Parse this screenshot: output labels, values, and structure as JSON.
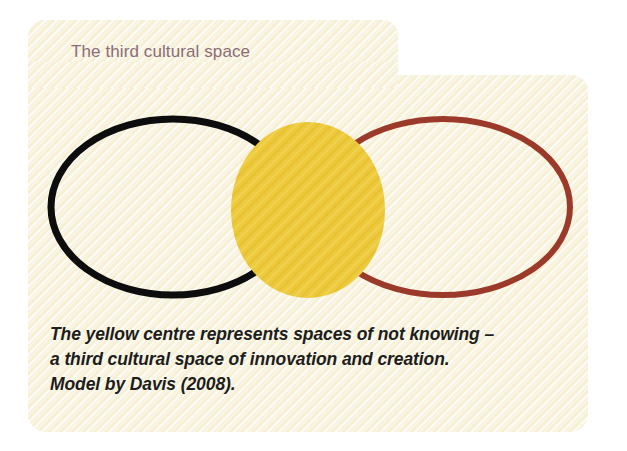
{
  "card": {
    "background_color": "#f7f2dd",
    "texture": "diagonal-stripe-paper"
  },
  "title": {
    "text": "The third cultural space",
    "color": "#8a6d78"
  },
  "diagram": {
    "name": "third-cultural-space-venn",
    "type": "venn-two-circle-overlap",
    "left_ellipse": {
      "label": "left-culture-ellipse",
      "stroke_color": "#0d0d0d",
      "stroke_width": 7,
      "cx": 145,
      "cy": 112,
      "rx": 122,
      "ry": 88
    },
    "right_ellipse": {
      "label": "right-culture-ellipse",
      "stroke_color": "#9b3a2a",
      "stroke_width": 6,
      "cx": 415,
      "cy": 112,
      "rx": 127,
      "ry": 88
    },
    "center_circle": {
      "label": "third-space-yellow-centre",
      "fill_color": "#edc93c",
      "cx": 280,
      "cy": 115,
      "rx": 77,
      "ry": 88
    }
  },
  "caption": {
    "lines": [
      "The yellow centre represents spaces of not knowing –",
      "a third cultural space of innovation and creation.",
      "Model by Davis (2008)."
    ],
    "color": "#1d1d1d"
  }
}
